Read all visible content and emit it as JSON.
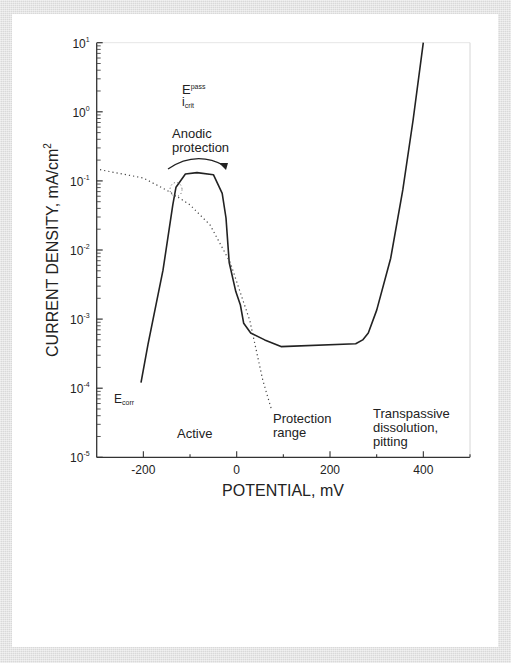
{
  "chart_data": {
    "type": "line",
    "title": "",
    "xlabel": "POTENTIAL, mV",
    "ylabel": "CURRENT DENSITY, mA/cm",
    "ylabel_superscript": "2",
    "xlim": [
      -300,
      500
    ],
    "ylim": [
      1e-05,
      10
    ],
    "yscale": "log",
    "grid": false,
    "x_ticks": [
      -200,
      0,
      200,
      400
    ],
    "x_tick_labels": [
      "-200",
      "0",
      "200",
      "400"
    ],
    "y_tick_labels": [
      {
        "base": "10",
        "exp": "1"
      },
      {
        "base": "10",
        "exp": "0"
      },
      {
        "base": "10",
        "exp": "-1"
      },
      {
        "base": "10",
        "exp": "-2"
      },
      {
        "base": "10",
        "exp": "-3"
      },
      {
        "base": "10",
        "exp": "-4"
      },
      {
        "base": "10",
        "exp": "-5"
      }
    ],
    "series": [
      {
        "name": "Anodic polarization curve",
        "style": "solid",
        "x": [
          -205,
          -190,
          -158,
          -137,
          -130,
          -110,
          -85,
          -50,
          -31,
          -23,
          -16,
          -2,
          8,
          15,
          30,
          60,
          95,
          255,
          270,
          282,
          300,
          330,
          356,
          378,
          400
        ],
        "y": [
          0.00012,
          0.00043,
          0.0051,
          0.045,
          0.081,
          0.126,
          0.132,
          0.123,
          0.066,
          0.029,
          0.0066,
          0.0025,
          0.0016,
          0.00087,
          0.00063,
          0.0005,
          0.0004,
          0.00044,
          0.0005,
          0.00063,
          0.00135,
          0.0076,
          0.074,
          0.76,
          10
        ]
      },
      {
        "name": "Cathodic curve",
        "style": "dotted",
        "x": [
          -293,
          -200,
          -143,
          -100,
          -57,
          -14,
          28,
          56,
          75
        ],
        "y": [
          0.145,
          0.11,
          0.069,
          0.045,
          0.023,
          0.0066,
          0.00095,
          0.00013,
          4.8e-05
        ]
      }
    ],
    "annotations": [
      {
        "text": "E",
        "sub": "pass",
        "x": -120,
        "y_log": 0.45
      },
      {
        "text": "i",
        "sub": "crit",
        "x": -120,
        "y_log": 0.2
      },
      {
        "text": "Anodic protection",
        "lines": [
          "Anodic",
          "protection"
        ],
        "x": -110,
        "y_log": -0.35
      },
      {
        "text": "E",
        "sub": "corr",
        "x": -260,
        "y_log": -4.2
      },
      {
        "text": "Active",
        "x": -110,
        "y_log": -4.6
      },
      {
        "text": "Protection range",
        "lines": [
          "Protection",
          "range"
        ],
        "x": 75,
        "y_log": -4.5
      },
      {
        "text": "Transpassive dissolution, pitting",
        "lines": [
          "Transpassive",
          "dissolution,",
          "pitting"
        ],
        "x": 300,
        "y_log": -4.45
      }
    ]
  },
  "labels": {
    "xlabel": "POTENTIAL, mV",
    "ylabel": "CURRENT DENSITY, mA/cm",
    "ylabel_sup": "2",
    "epass_main": "E",
    "epass_sub": "pass",
    "icrit_main": "i",
    "icrit_sub": "crit",
    "anodic_line1": "Anodic",
    "anodic_line2": "protection",
    "ecorr_main": "E",
    "ecorr_sub": "corr",
    "active": "Active",
    "protection_line1": "Protection",
    "protection_line2": "range",
    "trans_line1": "Transpassive",
    "trans_line2": "dissolution,",
    "trans_line3": "pitting"
  }
}
